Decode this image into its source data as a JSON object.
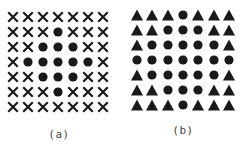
{
  "figure": {
    "panels": [
      {
        "id": "a",
        "caption": "(a)",
        "caption_pos": [
          59,
          134
        ],
        "origin": [
          13,
          17
        ],
        "spacing": [
          15,
          15
        ],
        "grid": [
          [
            "x",
            "x",
            "x",
            "x",
            "x",
            "x",
            "x"
          ],
          [
            "x",
            "x",
            "x",
            "o",
            "x",
            "x",
            "x"
          ],
          [
            "x",
            "x",
            "o",
            "o",
            "o",
            "x",
            "x"
          ],
          [
            "x",
            "o",
            "o",
            "o",
            "o",
            "o",
            "x"
          ],
          [
            "x",
            "x",
            "o",
            "o",
            "o",
            "x",
            "x"
          ],
          [
            "x",
            "x",
            "x",
            "o",
            "x",
            "x",
            "x"
          ],
          [
            "x",
            "x",
            "x",
            "x",
            "x",
            "x",
            "x"
          ]
        ]
      },
      {
        "id": "b",
        "caption": "(b)",
        "caption_pos": [
          183,
          130
        ],
        "origin": [
          137,
          15
        ],
        "spacing": [
          15.3,
          15
        ],
        "grid": [
          [
            "t",
            "t",
            "t",
            "o",
            "t",
            "t",
            "t"
          ],
          [
            "t",
            "t",
            "o",
            "o",
            "o",
            "t",
            "t"
          ],
          [
            "t",
            "o",
            "o",
            "o",
            "o",
            "o",
            "t"
          ],
          [
            "o",
            "o",
            "o",
            "o",
            "o",
            "o",
            "o"
          ],
          [
            "t",
            "o",
            "o",
            "o",
            "o",
            "o",
            "t"
          ],
          [
            "t",
            "t",
            "o",
            "o",
            "o",
            "t",
            "t"
          ],
          [
            "t",
            "t",
            "t",
            "o",
            "t",
            "t",
            "t"
          ]
        ]
      }
    ],
    "legend_symbols": {
      "x": "cross-icon",
      "o": "filled-circle-icon",
      "t": "filled-triangle-icon"
    },
    "colors": {
      "symbol": "#1a1a1a",
      "caption": "#444444",
      "background": "#ffffff"
    }
  }
}
